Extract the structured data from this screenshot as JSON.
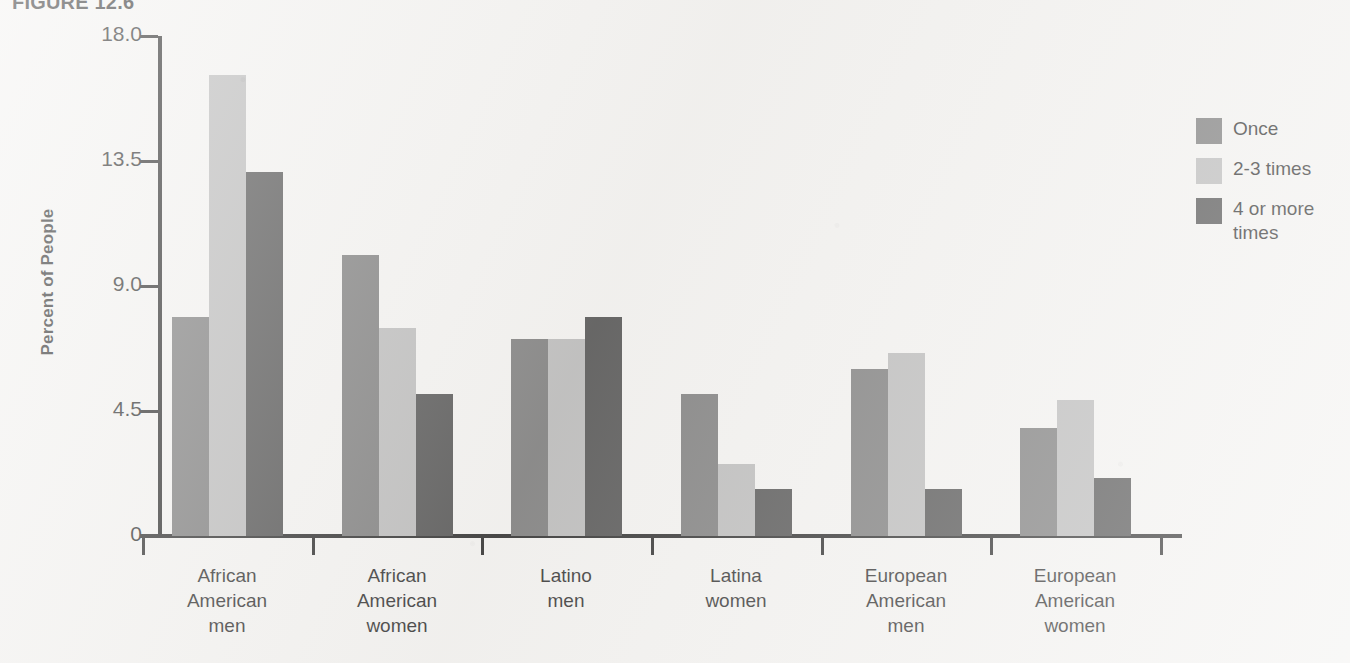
{
  "figure": {
    "title": "FIGURE 12.6"
  },
  "chart_data": {
    "type": "bar",
    "title": "FIGURE 12.6",
    "xlabel": "",
    "ylabel": "Percent of People",
    "ylim": [
      0,
      18.0
    ],
    "y_ticks": [
      "0",
      "4.5",
      "9.0",
      "13.5",
      "18.0"
    ],
    "y_tick_values": [
      0,
      4.5,
      9.0,
      13.5,
      18.0
    ],
    "grid": false,
    "legend_position": "right",
    "categories": [
      "African\nAmerican\nmen",
      "African\nAmerican\nwomen",
      "Latino\nmen",
      "Latina\nwomen",
      "European\nAmerican\nmen",
      "European\nAmerican\nwomen"
    ],
    "series": [
      {
        "name": "Once",
        "color": "#6b6b6b",
        "values": [
          7.9,
          10.1,
          7.1,
          5.1,
          6.0,
          3.9
        ]
      },
      {
        "name": "2-3 times",
        "color": "#b2b2b2",
        "values": [
          16.6,
          7.5,
          7.1,
          2.6,
          6.6,
          4.9
        ]
      },
      {
        "name": "4 or more\ntimes",
        "color": "#3b3b3b",
        "values": [
          13.1,
          5.1,
          7.9,
          1.7,
          1.7,
          2.1
        ]
      }
    ]
  },
  "legend": {
    "entries": [
      {
        "label": "Once",
        "color": "#6b6b6b"
      },
      {
        "label": "2-3 times",
        "color": "#b2b2b2"
      },
      {
        "label": "4 or more\ntimes",
        "color": "#3b3b3b"
      }
    ]
  }
}
